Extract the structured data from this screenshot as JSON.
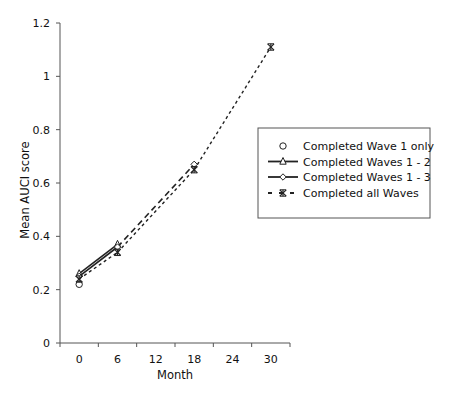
{
  "chart_data": {
    "type": "line",
    "title": "",
    "xlabel": "Month",
    "ylabel": "Mean AUCI score",
    "categories": [
      "0",
      "6",
      "12",
      "18",
      "24",
      "30"
    ],
    "x": [
      0,
      6,
      12,
      18,
      24,
      30
    ],
    "yticks": [
      "0",
      "0.2",
      "0.4",
      "0.6",
      "0.8",
      "1",
      "1.2"
    ],
    "ylim": [
      0,
      1.2
    ],
    "grid": false,
    "legend_position": "right-center (boxed)",
    "series": [
      {
        "name": "Completed Wave 1 only",
        "marker": "circle",
        "line": "none",
        "values": [
          0.22,
          null,
          null,
          null,
          null,
          null
        ]
      },
      {
        "name": "Completed Waves 1 - 2",
        "marker": "triangle",
        "line": "solid",
        "values": [
          0.26,
          0.37,
          null,
          null,
          null,
          null
        ]
      },
      {
        "name": "Completed Waves 1 - 3",
        "marker": "diamond",
        "line": "solid",
        "values": [
          0.25,
          0.36,
          null,
          0.67,
          null,
          null
        ]
      },
      {
        "name": "Completed all Waves",
        "marker": "star",
        "line": "dashed",
        "values": [
          0.24,
          0.34,
          null,
          0.65,
          null,
          1.11
        ]
      }
    ]
  },
  "legend": {
    "items": [
      {
        "label": "Completed Wave 1 only"
      },
      {
        "label": "Completed Waves 1 - 2"
      },
      {
        "label": "Completed Waves 1 - 3"
      },
      {
        "label": "Completed all Waves"
      }
    ]
  },
  "colors": {
    "line": "#222222",
    "axis": "#555555",
    "legend_border": "#555555"
  }
}
